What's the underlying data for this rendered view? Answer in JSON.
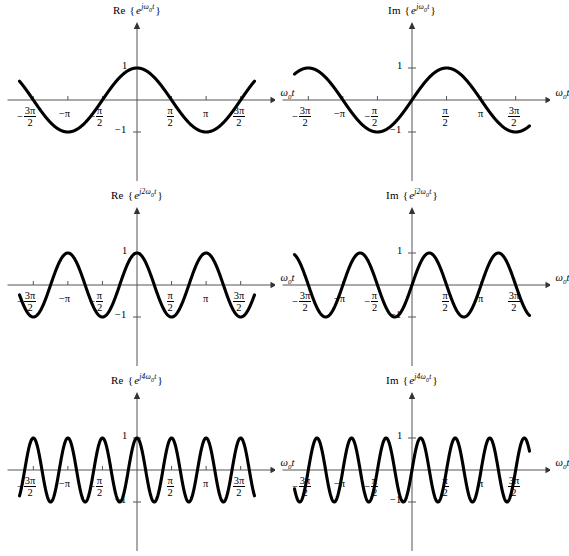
{
  "figure": {
    "background_color": "#ffffff",
    "width": 550,
    "height": 556,
    "curve_color": "#000000",
    "axis_color": "#555555",
    "xaxis_label": "ω",
    "xaxis_label_sub": "0",
    "xaxis_label_var": "t",
    "ytick_pos_label": "1",
    "ytick_neg_label": "−1"
  },
  "tick_labels": {
    "neg_3pi_2_sign": "−",
    "neg_3pi_2_num": "3π",
    "neg_3pi_2_den": "2",
    "neg_pi": "−π",
    "neg_pi_2_sign": "−",
    "neg_pi_2_num": "π",
    "neg_pi_2_den": "2",
    "pi_2_num": "π",
    "pi_2_den": "2",
    "pi": "π",
    "pos_3pi_2_num": "3π",
    "pos_3pi_2_den": "2"
  },
  "chart_data": [
    {
      "id": "re-1",
      "type": "line",
      "title_func": "Re",
      "title_open": "{",
      "title_base": "e",
      "title_exponent": "jω",
      "title_exponent_sub": "0",
      "title_exponent_tail": "t",
      "title_close": "}",
      "expression": "cos(ω₀t)",
      "waveform": "cos",
      "harmonic": 1,
      "amplitude": 1,
      "xlabel": "ω₀t",
      "ylabel": "",
      "xlim": [
        -5.34,
        5.34
      ],
      "ylim": [
        -1.35,
        1.35
      ],
      "xticks": [
        -4.712,
        -3.142,
        -1.571,
        1.571,
        3.142,
        4.712
      ],
      "xticklabels": [
        "-3pi/2",
        "-pi",
        "-pi/2",
        "pi/2",
        "pi",
        "3pi/2"
      ],
      "yticks": [
        -1,
        1
      ],
      "yticklabels": [
        "−1",
        "1"
      ],
      "grid": false,
      "legend": false
    },
    {
      "id": "im-1",
      "type": "line",
      "title_func": "Im",
      "title_open": "{",
      "title_base": "e",
      "title_exponent": "jω",
      "title_exponent_sub": "0",
      "title_exponent_tail": "t",
      "title_close": "}",
      "expression": "sin(ω₀t)",
      "waveform": "sin",
      "harmonic": 1,
      "amplitude": 1,
      "xlabel": "ω₀t",
      "ylabel": "",
      "xlim": [
        -5.34,
        5.34
      ],
      "ylim": [
        -1.35,
        1.35
      ],
      "xticks": [
        -4.712,
        -3.142,
        -1.571,
        1.571,
        3.142,
        4.712
      ],
      "xticklabels": [
        "-3pi/2",
        "-pi",
        "-pi/2",
        "pi/2",
        "pi",
        "3pi/2"
      ],
      "yticks": [
        -1,
        1
      ],
      "yticklabels": [
        "−1",
        "1"
      ],
      "grid": false,
      "legend": false
    },
    {
      "id": "re-2",
      "type": "line",
      "title_func": "Re",
      "title_open": "{",
      "title_base": "e",
      "title_exponent": "j2ω",
      "title_exponent_sub": "0",
      "title_exponent_tail": "t",
      "title_close": "}",
      "expression": "cos(2ω₀t)",
      "waveform": "cos",
      "harmonic": 2,
      "amplitude": 1,
      "xlabel": "ω₀t",
      "ylabel": "",
      "xlim": [
        -5.34,
        5.34
      ],
      "ylim": [
        -1.35,
        1.35
      ],
      "xticks": [
        -4.712,
        -3.142,
        -1.571,
        1.571,
        3.142,
        4.712
      ],
      "xticklabels": [
        "-3pi/2",
        "-pi",
        "-pi/2",
        "pi/2",
        "pi",
        "3pi/2"
      ],
      "yticks": [
        -1,
        1
      ],
      "yticklabels": [
        "−1",
        "1"
      ],
      "grid": false,
      "legend": false
    },
    {
      "id": "im-2",
      "type": "line",
      "title_func": "Im",
      "title_open": "{",
      "title_base": "e",
      "title_exponent": "j2ω",
      "title_exponent_sub": "0",
      "title_exponent_tail": "t",
      "title_close": "}",
      "expression": "sin(2ω₀t)",
      "waveform": "sin",
      "harmonic": 2,
      "amplitude": 1,
      "xlabel": "ω₀t",
      "ylabel": "",
      "xlim": [
        -5.34,
        5.34
      ],
      "ylim": [
        -1.35,
        1.35
      ],
      "xticks": [
        -4.712,
        -3.142,
        -1.571,
        1.571,
        3.142,
        4.712
      ],
      "xticklabels": [
        "-3pi/2",
        "-pi",
        "-pi/2",
        "pi/2",
        "pi",
        "3pi/2"
      ],
      "yticks": [
        -1,
        1
      ],
      "yticklabels": [
        "−1",
        "1"
      ],
      "grid": false,
      "legend": false
    },
    {
      "id": "re-4",
      "type": "line",
      "title_func": "Re",
      "title_open": "{",
      "title_base": "e",
      "title_exponent": "j4ω",
      "title_exponent_sub": "0",
      "title_exponent_tail": "t",
      "title_close": "}",
      "expression": "cos(4ω₀t)",
      "waveform": "cos",
      "harmonic": 4,
      "amplitude": 1,
      "xlabel": "ω₀t",
      "ylabel": "",
      "xlim": [
        -5.34,
        5.34
      ],
      "ylim": [
        -1.35,
        1.35
      ],
      "xticks": [
        -4.712,
        -3.142,
        -1.571,
        1.571,
        3.142,
        4.712
      ],
      "xticklabels": [
        "-3pi/2",
        "-pi",
        "-pi/2",
        "pi/2",
        "pi",
        "3pi/2"
      ],
      "yticks": [
        -1,
        1
      ],
      "yticklabels": [
        "−1",
        "1"
      ],
      "grid": false,
      "legend": false
    },
    {
      "id": "im-4",
      "type": "line",
      "title_func": "Im",
      "title_open": "{",
      "title_base": "e",
      "title_exponent": "j4ω",
      "title_exponent_sub": "0",
      "title_exponent_tail": "t",
      "title_close": "}",
      "expression": "sin(4ω₀t)",
      "waveform": "sin",
      "harmonic": 4,
      "amplitude": 1,
      "xlabel": "ω₀t",
      "ylabel": "",
      "xlim": [
        -5.34,
        5.34
      ],
      "ylim": [
        -1.35,
        1.35
      ],
      "xticks": [
        -4.712,
        -3.142,
        -1.571,
        1.571,
        3.142,
        4.712
      ],
      "xticklabels": [
        "-3pi/2",
        "-pi",
        "-pi/2",
        "pi/2",
        "pi",
        "3pi/2"
      ],
      "yticks": [
        -1,
        1
      ],
      "yticklabels": [
        "−1",
        "1"
      ],
      "grid": false,
      "legend": false
    }
  ]
}
